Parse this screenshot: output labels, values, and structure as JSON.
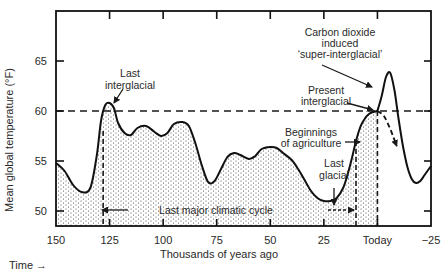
{
  "chart_data": {
    "type": "line",
    "title": "",
    "xlabel": "Thousands of years ago",
    "ylabel": "Mean global temperature (°F)",
    "time_label": "Time →",
    "xlim": [
      150,
      -25
    ],
    "ylim": [
      49,
      67
    ],
    "x_ticks": [
      150,
      125,
      100,
      75,
      50,
      25,
      0,
      -25
    ],
    "x_tick_labels": [
      "150",
      "125",
      "100",
      "75",
      "50",
      "25",
      "Today",
      "−25"
    ],
    "y_ticks": [
      50,
      55,
      60,
      65
    ],
    "y_tick_labels": [
      "50",
      "55",
      "60",
      "65"
    ],
    "grid": false,
    "reference_line": {
      "y": 60,
      "style": "dashed",
      "label": "Present interglacial level"
    },
    "series": [
      {
        "name": "Observed temperature (past)",
        "style": "solid, stippled fill below",
        "x": [
          150,
          146,
          142,
          138,
          134,
          131,
          129,
          127,
          125,
          123,
          121,
          118,
          115,
          112,
          108,
          104,
          101,
          98,
          95,
          91,
          88,
          85,
          82,
          79,
          76,
          73,
          70,
          67,
          64,
          60,
          57,
          54,
          50,
          47,
          44,
          40,
          37,
          34,
          31,
          28,
          25,
          22,
          19,
          16,
          14,
          12,
          10,
          8,
          6,
          4,
          2,
          0
        ],
        "y": [
          54.8,
          54.0,
          52.6,
          51.9,
          52.3,
          55.5,
          59.0,
          60.6,
          60.8,
          60.3,
          58.8,
          57.8,
          57.6,
          58.3,
          58.5,
          57.9,
          57.5,
          57.8,
          58.7,
          58.9,
          58.5,
          56.8,
          54.6,
          52.9,
          53.0,
          54.2,
          55.4,
          55.8,
          55.6,
          55.2,
          55.5,
          56.2,
          56.4,
          56.3,
          55.8,
          55.1,
          54.2,
          53.1,
          52.0,
          51.3,
          51.0,
          51.0,
          51.3,
          52.3,
          53.6,
          55.2,
          57.0,
          58.4,
          59.2,
          59.7,
          59.9,
          60.0
        ]
      },
      {
        "name": "Carbon dioxide induced 'super-interglacial' (projection)",
        "style": "solid",
        "x": [
          0,
          -2,
          -4,
          -6,
          -8,
          -10,
          -12,
          -14,
          -16,
          -18,
          -20,
          -22,
          -25
        ],
        "y": [
          60.0,
          61.5,
          63.4,
          63.8,
          62.0,
          59.0,
          56.4,
          54.4,
          53.2,
          52.8,
          53.0,
          53.6,
          54.5
        ]
      },
      {
        "name": "Natural cooling trend (projection)",
        "style": "dashed arrow",
        "x": [
          0,
          -3,
          -6,
          -9
        ],
        "y": [
          60.0,
          59.5,
          58.2,
          56.5
        ]
      }
    ],
    "annotations": [
      {
        "text": "Last interglacial",
        "points_to": {
          "x": 125,
          "y": 60.8
        }
      },
      {
        "text": "Carbon dioxide induced 'super-interglacial'",
        "points_to": {
          "x": -4,
          "y": 63.4
        }
      },
      {
        "text": "Present interglacial",
        "points_to": {
          "x": 0,
          "y": 60.0
        }
      },
      {
        "text": "Beginnings of agriculture",
        "points_to": {
          "x": 6,
          "y": 59.2
        }
      },
      {
        "text": "Last glacial",
        "points_to": {
          "x": 20,
          "y": 51.0
        }
      },
      {
        "text": "Last major climatic cycle",
        "span": [
          128,
          10
        ]
      }
    ],
    "vertical_markers": [
      {
        "x": 128,
        "style": "dashed"
      },
      {
        "x": 10,
        "style": "dashed"
      },
      {
        "x": 0,
        "style": "dashed"
      }
    ]
  },
  "labels": {
    "y_axis_title": "Mean global temperature (°F)",
    "x_axis_title": "Thousands of years ago",
    "time_label": "Time →",
    "ann_last_interglacial_1": "Last",
    "ann_last_interglacial_2": "interglacial",
    "ann_co2_1": "Carbon dioxide",
    "ann_co2_2": "induced",
    "ann_co2_3": "‘super-interglacial’",
    "ann_present_1": "Present",
    "ann_present_2": "interglacial",
    "ann_agri_1": "Beginnings",
    "ann_agri_2": "of agriculture",
    "ann_glacial_1": "Last",
    "ann_glacial_2": "glacial",
    "ann_cycle": "Last major climatic cycle"
  }
}
